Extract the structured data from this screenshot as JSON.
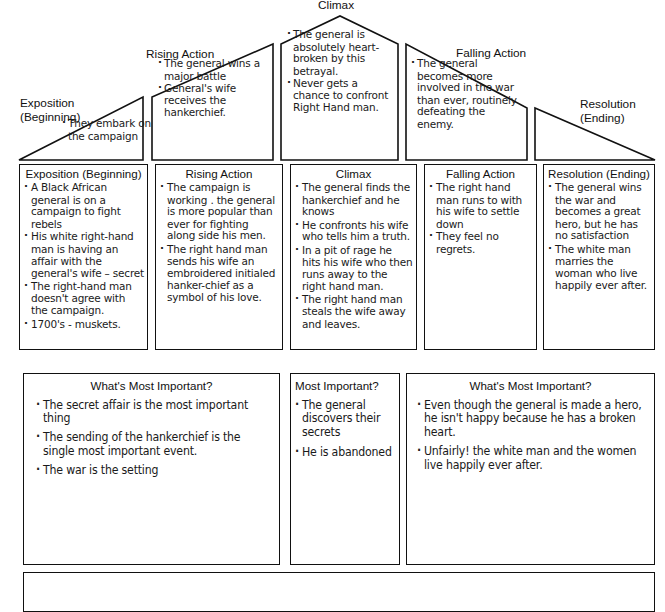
{
  "document": {
    "type": "plot-diagram-worksheet",
    "faint_header": "",
    "ink_color": "#111111",
    "paper_color": "#ffffff"
  },
  "arc": {
    "stages": [
      {
        "key": "exposition",
        "label": "Exposition\n(Beginning)"
      },
      {
        "key": "rising_action",
        "label": "Rising Action"
      },
      {
        "key": "climax",
        "label": "Climax"
      },
      {
        "key": "falling_action",
        "label": "Falling Action"
      },
      {
        "key": "resolution",
        "label": "Resolution\n(Ending)"
      }
    ],
    "notes": {
      "exposition": [
        "They embark on the campaign"
      ],
      "rising_action": [
        "The general wins a major battle",
        "General's wife receives the hankerchief."
      ],
      "climax": [
        "The general is absolutely heart-broken by this betrayal.",
        "Never gets a chance to confront Right Hand man."
      ],
      "falling_action": [
        "The general becomes more involved in the war than ever, routinely defeating the enemy."
      ],
      "resolution": []
    }
  },
  "detail_row": {
    "columns": [
      {
        "key": "exposition",
        "title": "Exposition (Beginning)",
        "items": [
          "A Black African general is on a campaign to fight rebels",
          "His white right-hand man is having an affair with the general's wife – secret",
          "The right-hand man doesn't agree with the campaign.",
          "1700's - muskets."
        ]
      },
      {
        "key": "rising_action",
        "title": "Rising Action",
        "items": [
          "The campaign is working . the general is more popular than ever for fighting along side his men.",
          "The right hand man sends his wife an embroidered initialed hanker-chief as a symbol of his love."
        ]
      },
      {
        "key": "climax",
        "title": "Climax",
        "items": [
          "The general finds the hankerchief and he knows",
          "He confronts his wife who tells him a truth.",
          "In a pit of rage he hits his wife who then runs away to the right hand man.",
          "The right hand man steals the wife away and leaves."
        ]
      },
      {
        "key": "falling_action",
        "title": "Falling Action",
        "items": [
          "The right hand man runs to with his wife to settle down",
          "They feel no regrets."
        ]
      },
      {
        "key": "resolution",
        "title": "Resolution (Ending)",
        "items": [
          "The general wins the war and becomes a great hero, but he has no satisfaction",
          "The white man marries the woman who live happily ever after."
        ]
      }
    ]
  },
  "importance_row": {
    "boxes": [
      {
        "key": "left",
        "title": "What's Most Important?",
        "items": [
          "The secret affair is the most important thing",
          "The sending of the hankerchief is the single most important event.",
          "The war is the setting"
        ]
      },
      {
        "key": "middle",
        "title": "Most Important?",
        "items": [
          "The general discovers their secrets",
          "He is abandoned"
        ]
      },
      {
        "key": "right",
        "title": "What's Most Important?",
        "items": [
          "Even though the general is made a hero, he isn't happy because he has a broken heart.",
          "Unfairly! the white man and the women live happily ever after."
        ]
      }
    ]
  },
  "bottom_strip": {
    "visible": true,
    "label": ""
  }
}
